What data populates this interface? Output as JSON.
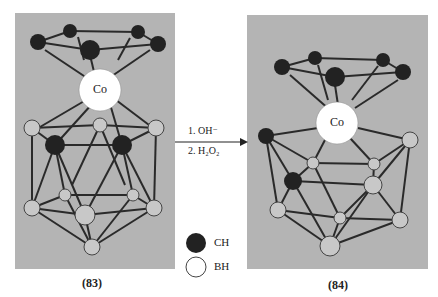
{
  "figure": {
    "header_fragment": "Co/B",
    "compounds": [
      {
        "id": "83",
        "label": "(83)",
        "metal_label": "Co"
      },
      {
        "id": "84",
        "label": "(84)",
        "metal_label": "Co"
      }
    ],
    "reaction": {
      "step1": "1.  OH⁻",
      "step2": "2.  H₂O₂"
    },
    "legend": [
      {
        "symbol": "filled-circle",
        "label": "CH",
        "color": "#222222"
      },
      {
        "symbol": "open-circle",
        "label": "BH",
        "color": "#ffffff"
      }
    ],
    "colors": {
      "panel_bg": "#b4b4b4",
      "ch_atom": "#222222",
      "bh_atom": "#c8c8c8",
      "co_atom": "#ffffff",
      "bond": "#2a2a2a"
    }
  }
}
